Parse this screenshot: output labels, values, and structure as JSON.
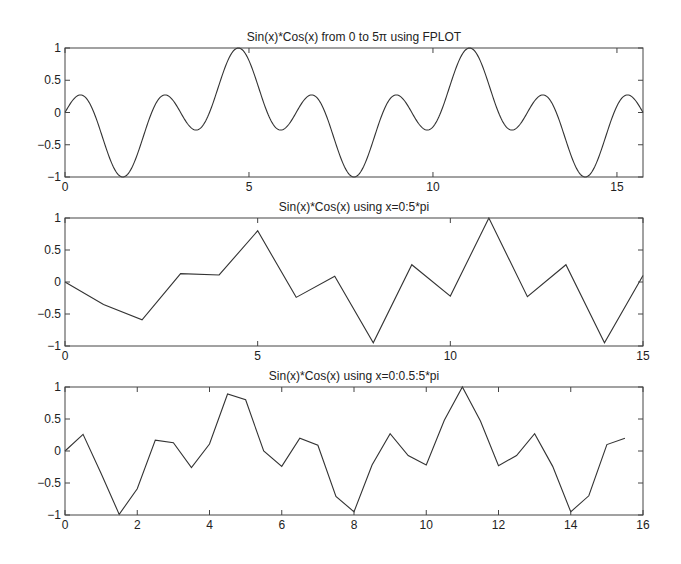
{
  "figure": {
    "background": "#ffffff",
    "line_color": "#333333",
    "axis_color": "#444444"
  },
  "chart_data": [
    {
      "type": "line",
      "title": "Sin(x)*Cos(x) from 0 to 5π using FPLOT",
      "xlabel": "",
      "ylabel": "",
      "xlim": [
        0,
        15.708
      ],
      "ylim": [
        -1,
        1
      ],
      "xticks": [
        0,
        5,
        10,
        15
      ],
      "xtick_labels": [
        "0",
        "5",
        "10",
        "15"
      ],
      "yticks": [
        -1,
        -0.5,
        0,
        0.5,
        1
      ],
      "ytick_labels": [
        "−1",
        "−0.5",
        "0",
        "0.5",
        "1"
      ],
      "grid": false,
      "legend": null,
      "smooth": true,
      "series": [
        {
          "name": "f(x)",
          "x": [
            0,
            0.25,
            0.5,
            0.75,
            1,
            1.25,
            1.5,
            1.75,
            2,
            2.25,
            2.5,
            2.75,
            3,
            3.25,
            3.5,
            3.75,
            4,
            4.25,
            4.5,
            4.75,
            5,
            5.25,
            5.5,
            5.75,
            6,
            6.25,
            6.5,
            6.75,
            7,
            7.25,
            7.5,
            7.75,
            8,
            8.25,
            8.5,
            8.75,
            9,
            9.25,
            9.5,
            9.75,
            10,
            10.25,
            10.5,
            10.75,
            11,
            11.25,
            11.5,
            11.75,
            12,
            12.25,
            12.5,
            12.75,
            13,
            13.25,
            13.5,
            13.75,
            14,
            14.25,
            14.5,
            14.75,
            15,
            15.25,
            15.5,
            15.708
          ],
          "y": [
            0,
            0.217,
            0.259,
            0.047,
            -0.35,
            -0.762,
            -0.988,
            -0.92,
            -0.594,
            -0.161,
            0.17,
            0.255,
            0.135,
            -0.106,
            -0.264,
            -0.183,
            0.11,
            0.517,
            0.891,
            0.988,
            0.805,
            0.341,
            -0.003,
            -0.117,
            -0.236,
            -0.238,
            0.195,
            0.258,
            0.09,
            -0.227,
            -0.713,
            -0.96,
            -0.948,
            -0.68,
            -0.22,
            0.154,
            0.272,
            0.142,
            -0.074,
            -0.178,
            -0.222,
            0.054,
            0.482,
            0.87,
            1.0,
            0.84,
            0.466,
            0.07,
            -0.228,
            -0.267,
            -0.066,
            0.207,
            0.272,
            0.027,
            -0.235,
            -0.658,
            -0.954,
            -0.944,
            -0.699,
            -0.252,
            0.1,
            0.248,
            0.197,
            0.0
          ]
        }
      ]
    },
    {
      "type": "line",
      "title": "Sin(x)*Cos(x) using x=0:5*pi",
      "xlabel": "",
      "ylabel": "",
      "xlim": [
        0,
        15
      ],
      "ylim": [
        -1,
        1
      ],
      "xticks": [
        0,
        5,
        10,
        15
      ],
      "xtick_labels": [
        "0",
        "5",
        "10",
        "15"
      ],
      "yticks": [
        -1,
        -0.5,
        0,
        0.5,
        1
      ],
      "ytick_labels": [
        "−1",
        "−0.5",
        "0",
        "0.5",
        "1"
      ],
      "grid": false,
      "legend": null,
      "smooth": false,
      "series": [
        {
          "name": "f(x)",
          "x": [
            0,
            1,
            2,
            3,
            4,
            5,
            6,
            7,
            8,
            9,
            10,
            11,
            12,
            13,
            14,
            15
          ],
          "y": [
            0,
            -0.35,
            -0.59,
            0.13,
            0.11,
            0.8,
            -0.24,
            0.09,
            -0.95,
            0.27,
            -0.22,
            1.0,
            -0.23,
            0.27,
            -0.95,
            0.1
          ]
        }
      ]
    },
    {
      "type": "line",
      "title": "Sin(x)*Cos(x) using x=0:0.5:5*pi",
      "xlabel": "",
      "ylabel": "",
      "xlim": [
        0,
        16
      ],
      "ylim": [
        -1,
        1
      ],
      "xticks": [
        0,
        2,
        4,
        6,
        8,
        10,
        12,
        14,
        16
      ],
      "xtick_labels": [
        "0",
        "2",
        "4",
        "6",
        "8",
        "10",
        "12",
        "14",
        "16"
      ],
      "yticks": [
        -1,
        -0.5,
        0,
        0.5,
        1
      ],
      "ytick_labels": [
        "−1",
        "−0.5",
        "0",
        "0.5",
        "1"
      ],
      "grid": false,
      "legend": null,
      "smooth": false,
      "series": [
        {
          "name": "f(x)",
          "x": [
            0,
            0.5,
            1,
            1.5,
            2,
            2.5,
            3,
            3.5,
            4,
            4.5,
            5,
            5.5,
            6,
            6.5,
            7,
            7.5,
            8,
            8.5,
            9,
            9.5,
            10,
            10.5,
            11,
            11.5,
            12,
            12.5,
            13,
            13.5,
            14,
            14.5,
            15,
            15.5
          ],
          "y": [
            0,
            0.26,
            -0.35,
            -0.99,
            -0.59,
            0.17,
            0.13,
            -0.26,
            0.11,
            0.89,
            0.8,
            0.0,
            -0.24,
            0.2,
            0.09,
            -0.71,
            -0.95,
            -0.22,
            0.27,
            -0.07,
            -0.22,
            0.48,
            1.0,
            0.47,
            -0.23,
            -0.07,
            0.27,
            -0.24,
            -0.95,
            -0.7,
            0.1,
            0.2
          ]
        }
      ]
    }
  ]
}
